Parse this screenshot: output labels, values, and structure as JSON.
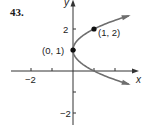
{
  "problem_number": "43.",
  "chart_data": {
    "type": "line",
    "title": "",
    "equation": "x = (y - 1)^2",
    "xlabel": "x",
    "ylabel": "y",
    "xlim": [
      -3,
      3
    ],
    "ylim": [
      -2.7,
      3.4
    ],
    "x_ticks": [
      -2,
      -1,
      1,
      2
    ],
    "x_tick_labels": [
      {
        "value": -2,
        "label": "−2"
      }
    ],
    "y_ticks": [
      -2,
      -1,
      1,
      2
    ],
    "y_tick_labels": [
      {
        "value": 2,
        "label": "2"
      },
      {
        "value": -2,
        "label": "−2"
      }
    ],
    "grid": false,
    "series": [
      {
        "name": "parabola",
        "color": "#6e6e6e",
        "parameter_range_y": [
          -0.63,
          2.63
        ],
        "arrows": "both-ends"
      }
    ],
    "points": [
      {
        "x": 0,
        "y": 1,
        "label": "(0, 1)",
        "label_side": "left"
      },
      {
        "x": 1,
        "y": 2,
        "label": "(1, 2)",
        "label_side": "right"
      }
    ],
    "axis_color": "#333333",
    "curve_color": "#6e6e6e",
    "point_color": "#111111"
  }
}
